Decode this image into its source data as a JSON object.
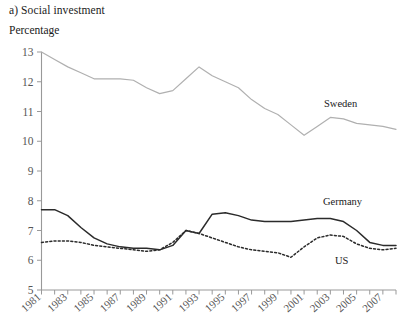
{
  "figure": {
    "title": "a) Social investment",
    "unit_label": "Percentage"
  },
  "labels": {
    "sweden": "Sweden",
    "germany": "Germany",
    "us": "US"
  },
  "chart_data": {
    "type": "line",
    "title": "a) Social investment",
    "xlabel": "",
    "ylabel": "Percentage",
    "ylim": [
      5,
      13
    ],
    "xlim": [
      1981,
      2008
    ],
    "yticks": [
      5,
      6,
      7,
      8,
      9,
      10,
      11,
      12,
      13
    ],
    "xticks": [
      1981,
      1983,
      1985,
      1987,
      1989,
      1991,
      1993,
      1995,
      1997,
      1999,
      2001,
      2003,
      2005,
      2007
    ],
    "grid": false,
    "legend_position": "inline-right",
    "x": [
      1981,
      1982,
      1983,
      1984,
      1985,
      1986,
      1987,
      1988,
      1989,
      1990,
      1991,
      1992,
      1993,
      1994,
      1995,
      1996,
      1997,
      1998,
      1999,
      2000,
      2001,
      2002,
      2003,
      2004,
      2005,
      2006,
      2007,
      2008
    ],
    "series": [
      {
        "name": "Sweden",
        "color": "#b0b0b0",
        "style": "solid",
        "values": [
          13.0,
          12.75,
          12.5,
          12.3,
          12.1,
          12.1,
          12.1,
          12.05,
          11.8,
          11.6,
          11.7,
          12.1,
          12.5,
          12.2,
          12.0,
          11.8,
          11.4,
          11.1,
          10.9,
          10.55,
          10.2,
          10.5,
          10.8,
          10.75,
          10.6,
          10.55,
          10.5,
          10.4
        ]
      },
      {
        "name": "Germany",
        "color": "#2b2b2b",
        "style": "solid",
        "values": [
          7.7,
          7.7,
          7.5,
          7.1,
          6.75,
          6.55,
          6.45,
          6.4,
          6.4,
          6.35,
          6.5,
          7.0,
          6.9,
          7.55,
          7.6,
          7.5,
          7.35,
          7.3,
          7.3,
          7.3,
          7.35,
          7.4,
          7.4,
          7.3,
          7.0,
          6.6,
          6.5,
          6.5
        ]
      },
      {
        "name": "US",
        "color": "#2b2b2b",
        "style": "dotted",
        "values": [
          6.6,
          6.65,
          6.65,
          6.6,
          6.5,
          6.45,
          6.4,
          6.35,
          6.3,
          6.35,
          6.6,
          7.0,
          6.9,
          6.75,
          6.6,
          6.45,
          6.35,
          6.3,
          6.25,
          6.1,
          6.45,
          6.75,
          6.85,
          6.8,
          6.55,
          6.4,
          6.35,
          6.4
        ]
      }
    ]
  }
}
